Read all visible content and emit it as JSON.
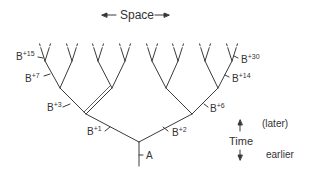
{
  "header": {
    "space_label": "Space"
  },
  "time_axis": {
    "label": "Time",
    "later": "(later)",
    "earlier": "earlier"
  },
  "labels": {
    "A": "A",
    "B1": {
      "base": "B",
      "sup": "+1"
    },
    "B2": {
      "base": "B",
      "sup": "+2"
    },
    "B3": {
      "base": "B",
      "sup": "+3"
    },
    "B6": {
      "base": "B",
      "sup": "+6"
    },
    "B7": {
      "base": "B",
      "sup": "+7"
    },
    "B14": {
      "base": "B",
      "sup": "+14"
    },
    "B15": {
      "base": "B",
      "sup": "+15"
    },
    "B30": {
      "base": "B",
      "sup": "+30"
    }
  },
  "colors": {
    "line": "#333333",
    "text": "#333333"
  }
}
